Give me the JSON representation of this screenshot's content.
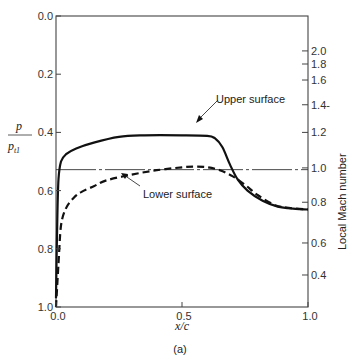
{
  "chart_data": {
    "type": "line",
    "title": "",
    "caption": "(a)",
    "xlabel": "x/c",
    "ylabel": "p / p_t1",
    "ylabel_num": "p",
    "ylabel_den": "p",
    "ylabel_den_sub": "t1",
    "y2label": "Local Mach number",
    "xlim": [
      0.0,
      1.0
    ],
    "ylim": [
      1.0,
      0.0
    ],
    "y_inverted": true,
    "grid": false,
    "x_ticks": [
      "0.0",
      "0.5",
      "1.0"
    ],
    "y_ticks": [
      "0.0",
      "0.2",
      "0.4",
      "0.6",
      "0.8",
      "1.0"
    ],
    "y2_ticks": [
      {
        "label": "2.0",
        "p": 0.12
      },
      {
        "label": "1.8",
        "p": 0.165
      },
      {
        "label": "1.6",
        "p": 0.22
      },
      {
        "label": "1.4-",
        "p": 0.305
      },
      {
        "label": "1.2",
        "p": 0.4
      },
      {
        "label": "1.0",
        "p": 0.522
      },
      {
        "label": "0.8",
        "p": 0.64
      },
      {
        "label": "0.6",
        "p": 0.78
      },
      {
        "label": "0.4",
        "p": 0.89
      }
    ],
    "sonic_line": {
      "p": 0.528,
      "style": "dash-dot",
      "label": "Mach 1.0"
    },
    "series": [
      {
        "name": "Upper surface",
        "style": "solid",
        "x": [
          0.0,
          0.005,
          0.01,
          0.02,
          0.04,
          0.08,
          0.15,
          0.25,
          0.35,
          0.5,
          0.6,
          0.63,
          0.66,
          0.69,
          0.72,
          0.76,
          0.82,
          0.88,
          0.94,
          1.0
        ],
        "y": [
          0.97,
          0.7,
          0.56,
          0.5,
          0.475,
          0.455,
          0.435,
          0.415,
          0.41,
          0.41,
          0.412,
          0.42,
          0.45,
          0.51,
          0.56,
          0.6,
          0.635,
          0.655,
          0.662,
          0.665
        ]
      },
      {
        "name": "Lower surface",
        "style": "dashed",
        "x": [
          0.0,
          0.01,
          0.02,
          0.04,
          0.07,
          0.1,
          0.15,
          0.2,
          0.3,
          0.4,
          0.5,
          0.55,
          0.6,
          0.65,
          0.7,
          0.75,
          0.8,
          0.87,
          0.93,
          1.0
        ],
        "y": [
          1.0,
          0.85,
          0.72,
          0.66,
          0.625,
          0.605,
          0.585,
          0.565,
          0.545,
          0.53,
          0.52,
          0.518,
          0.52,
          0.53,
          0.55,
          0.58,
          0.615,
          0.65,
          0.66,
          0.665
        ]
      }
    ],
    "annotations": [
      {
        "text": "Upper surface",
        "points_to": "series 0 near x=0.6"
      },
      {
        "text": "Lower surface",
        "points_to": "series 1 near x=0.35"
      }
    ]
  }
}
